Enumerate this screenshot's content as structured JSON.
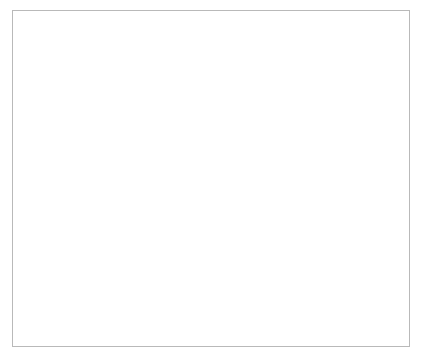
{
  "chart_data": {
    "type": "line",
    "title": "",
    "xlabel": "Year",
    "ylabel": "000 Ounces",
    "x": [
      1986,
      1987,
      1988,
      1989,
      1990,
      1991,
      1992,
      1993,
      1994,
      1995
    ],
    "xtick_labels": [
      "1986",
      "1987",
      "1988",
      "1989",
      "1990",
      "1991",
      "1992",
      "1993",
      "1994",
      "1995"
    ],
    "ytick_labels": [
      "0",
      "200",
      "400",
      "600",
      "800",
      "1000",
      "1200",
      "1400",
      "1600",
      "1800",
      "2000"
    ],
    "ytick_values": [
      0,
      200,
      400,
      600,
      800,
      1000,
      1200,
      1400,
      1600,
      1800,
      2000
    ],
    "ylim": [
      0,
      2000
    ],
    "xlim": [
      1986,
      1995
    ],
    "grid": false,
    "legend_position": "center-right",
    "series": [
      {
        "name": "Auto",
        "style": "solid",
        "color": "#3a3a3a",
        "values": [
          1150,
          1245,
          1310,
          1390,
          1470,
          1550,
          1545,
          1690,
          1885,
          1850
        ]
      },
      {
        "name": "Jewelry",
        "style": "dotted",
        "color": "#8d8d8d",
        "values": [
          870,
          980,
          1080,
          1200,
          1290,
          1350,
          1390,
          1520,
          1700,
          1810
        ]
      }
    ]
  },
  "legend": {
    "entries": [
      {
        "label": "Auto"
      },
      {
        "label": "Jewelry"
      }
    ]
  }
}
